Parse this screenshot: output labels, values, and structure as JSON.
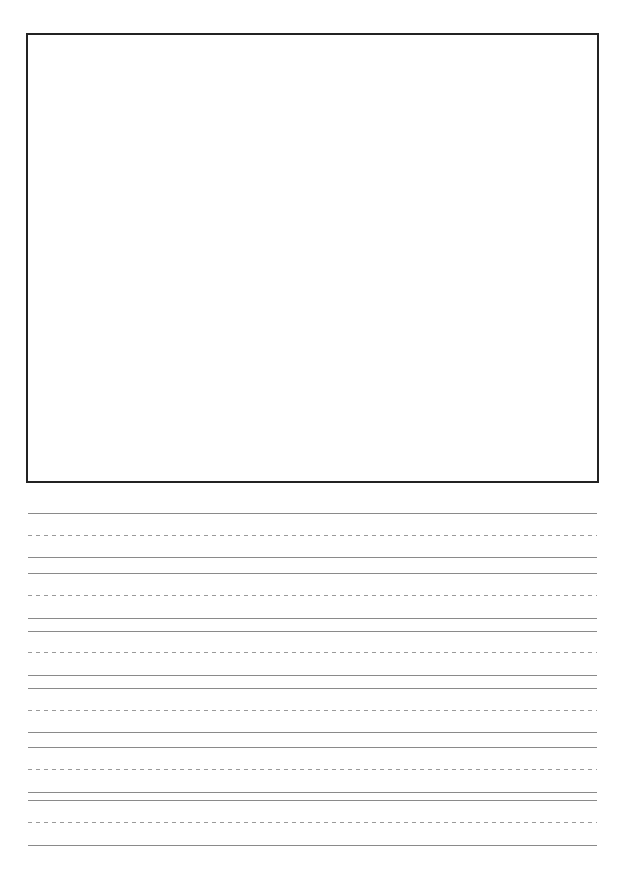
{
  "page": {
    "type": "handwriting-practice-sheet",
    "background_color": "#ffffff"
  },
  "drawing_box": {
    "border_color": "#232323",
    "label": ""
  },
  "writing_lines": {
    "line_color": "#8a8a8a",
    "dash_color": "#9a9a9a",
    "rows": [
      {
        "top": 513,
        "midline": 535,
        "baseline": 557
      },
      {
        "top": 573,
        "midline": 595,
        "baseline": 618
      },
      {
        "top": 631,
        "midline": 652,
        "baseline": 675
      },
      {
        "top": 688,
        "midline": 710,
        "baseline": 732
      },
      {
        "top": 747,
        "midline": 769,
        "baseline": 792
      },
      {
        "top": 800,
        "midline": 822,
        "baseline": 845
      }
    ]
  }
}
